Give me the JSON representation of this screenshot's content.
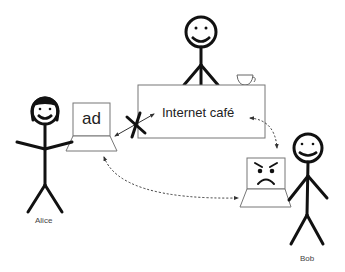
{
  "diagram": {
    "type": "illustration",
    "nodes": {
      "cafe": {
        "label": "Internet café"
      },
      "alice_laptop": {
        "screen_text": "ad"
      },
      "alice": {
        "label": "Alice"
      },
      "bob": {
        "label": "Bob"
      },
      "bob_laptop": {
        "screen_face": "angry"
      },
      "cafe_owner": {
        "label": ""
      }
    },
    "edges": [
      {
        "from": "alice_laptop",
        "to": "cafe",
        "style": "solid",
        "bidirectional": true,
        "blocked": true,
        "marker": "X"
      },
      {
        "from": "cafe",
        "to": "bob_laptop",
        "style": "dotted",
        "bidirectional": true
      },
      {
        "from": "alice_laptop",
        "to": "bob_laptop",
        "style": "dotted",
        "bidirectional": true
      }
    ]
  }
}
